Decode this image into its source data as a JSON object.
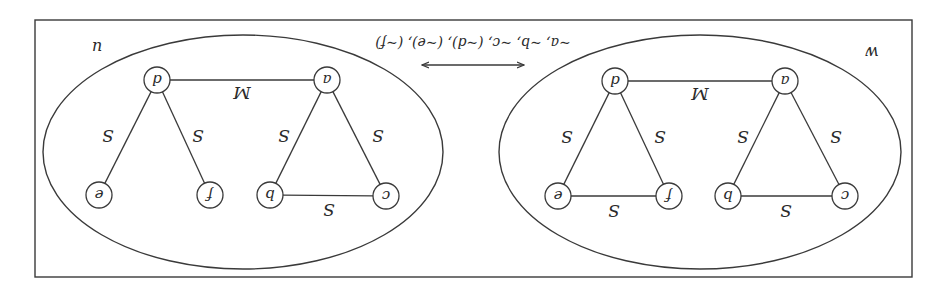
{
  "orientation": {
    "rotation_deg": 180
  },
  "colors": {
    "stroke": "#3a3a3a",
    "text": "#2a2a2a",
    "background": "#ffffff"
  },
  "frame": {
    "x": 34,
    "y": 18,
    "width": 877,
    "height": 257
  },
  "arrow": {
    "x1": 422,
    "x2": 524,
    "y": 230,
    "label": "~a, ~b, ~c, (~d), (~e), (~f)",
    "label_x": 473,
    "label_y": 257,
    "direction": "bidirectional"
  },
  "graphs": [
    {
      "name": "w",
      "label": "w",
      "label_pos": {
        "x": 74,
        "y": 248
      },
      "ellipse": {
        "cx": 246,
        "cy": 143,
        "rx": 201,
        "ry": 117
      },
      "nodes": [
        {
          "id": "a",
          "label": "a",
          "x": 161,
          "y": 214
        },
        {
          "id": "d",
          "label": "d",
          "x": 331,
          "y": 214
        },
        {
          "id": "c",
          "label": "c",
          "x": 101,
          "y": 99
        },
        {
          "id": "b",
          "label": "b",
          "x": 218,
          "y": 99
        },
        {
          "id": "f",
          "label": "f",
          "x": 277,
          "y": 99
        },
        {
          "id": "e",
          "label": "e",
          "x": 388,
          "y": 99
        }
      ],
      "edges": [
        {
          "from": "a",
          "to": "d",
          "label": "M",
          "lx": 246,
          "ly": 203
        },
        {
          "from": "a",
          "to": "c",
          "label": "S",
          "lx": 110,
          "ly": 160
        },
        {
          "from": "a",
          "to": "b",
          "label": "S",
          "lx": 203,
          "ly": 160
        },
        {
          "from": "b",
          "to": "c",
          "label": "S",
          "lx": 160,
          "ly": 86
        },
        {
          "from": "d",
          "to": "f",
          "label": "S",
          "lx": 286,
          "ly": 160
        },
        {
          "from": "d",
          "to": "e",
          "label": "S",
          "lx": 379,
          "ly": 160
        },
        {
          "from": "e",
          "to": "f",
          "label": "S",
          "lx": 332,
          "ly": 86
        }
      ]
    },
    {
      "name": "u",
      "label": "u",
      "label_pos": {
        "x": 849,
        "y": 253
      },
      "ellipse": {
        "cx": 703,
        "cy": 143,
        "rx": 200,
        "ry": 117
      },
      "nodes": [
        {
          "id": "a",
          "label": "a",
          "x": 619,
          "y": 215
        },
        {
          "id": "d",
          "label": "d",
          "x": 789,
          "y": 215
        },
        {
          "id": "c",
          "label": "c",
          "x": 560,
          "y": 99
        },
        {
          "id": "b",
          "label": "b",
          "x": 676,
          "y": 100
        },
        {
          "id": "f",
          "label": "f",
          "x": 736,
          "y": 100
        },
        {
          "id": "e",
          "label": "e",
          "x": 847,
          "y": 100
        }
      ],
      "edges": [
        {
          "from": "a",
          "to": "d",
          "label": "M",
          "lx": 704,
          "ly": 204
        },
        {
          "from": "a",
          "to": "c",
          "label": "S",
          "lx": 568,
          "ly": 161
        },
        {
          "from": "a",
          "to": "b",
          "label": "S",
          "lx": 662,
          "ly": 161
        },
        {
          "from": "b",
          "to": "c",
          "label": "S",
          "lx": 617,
          "ly": 87
        },
        {
          "from": "d",
          "to": "f",
          "label": "S",
          "lx": 748,
          "ly": 161
        },
        {
          "from": "d",
          "to": "e",
          "label": "S",
          "lx": 838,
          "ly": 161
        }
      ]
    }
  ]
}
